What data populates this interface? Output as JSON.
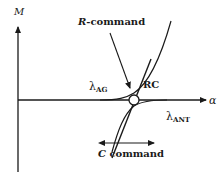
{
  "diagram": {
    "axes": {
      "y_label": "M",
      "x_label": "α"
    },
    "curves": {
      "lambda_ag": {
        "symbol": "λ",
        "subscript": "AG"
      },
      "lambda_ant": {
        "symbol": "λ",
        "subscript": "ANT"
      },
      "rc": {
        "label": "RC"
      }
    },
    "annotations": {
      "r_command": {
        "prefix": "R",
        "suffix": "-command"
      },
      "c_command": {
        "prefix": "C",
        "suffix": " command"
      }
    },
    "colors": {
      "stroke": "#1a1a1a",
      "background": "#ffffff"
    }
  }
}
